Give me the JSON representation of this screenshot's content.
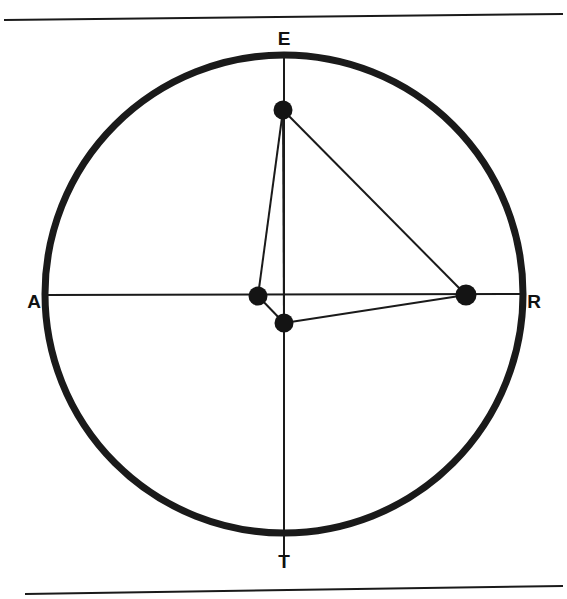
{
  "figure": {
    "background_color": "#ffffff",
    "stroke_color": "#1a1a1a",
    "node_fill_color": "#141414",
    "canvas": {
      "width": 567,
      "height": 599
    }
  },
  "rules": {
    "top": {
      "name": "top-rule",
      "x1": 4,
      "y1": 20,
      "x2": 563,
      "y2": 14,
      "stroke_width": 2
    },
    "bottom": {
      "name": "bottom-rule",
      "x1": 25,
      "y1": 594,
      "x2": 563,
      "y2": 586,
      "stroke_width": 2
    }
  },
  "circle": {
    "cx": 284,
    "cy": 294,
    "r": 239,
    "stroke_width": 7
  },
  "labels": [
    {
      "id": "E",
      "text": "E",
      "x": 284,
      "y": 45,
      "anchor": "middle"
    },
    {
      "id": "A",
      "text": "A",
      "x": 34,
      "y": 308,
      "anchor": "middle"
    },
    {
      "id": "R",
      "text": "R",
      "x": 534,
      "y": 308,
      "anchor": "middle"
    },
    {
      "id": "T",
      "text": "T",
      "x": 284,
      "y": 568,
      "anchor": "middle"
    }
  ],
  "diameters": [
    {
      "id": "AR",
      "name": "diameter-a-r",
      "x1": 45,
      "y1": 295,
      "x2": 523,
      "y2": 294,
      "stroke_width": 2
    },
    {
      "id": "ET",
      "name": "diameter-e-t",
      "x1": 284,
      "y1": 55,
      "x2": 284,
      "y2": 565,
      "stroke_width": 2
    }
  ],
  "nodes": [
    {
      "id": "P1",
      "name": "node-upper",
      "cx": 283,
      "cy": 110,
      "r": 9.5
    },
    {
      "id": "P2",
      "name": "node-center",
      "cx": 258,
      "cy": 296,
      "r": 9.5
    },
    {
      "id": "P3",
      "name": "node-lower",
      "cx": 284,
      "cy": 323,
      "r": 9.5
    },
    {
      "id": "P4",
      "name": "node-right",
      "cx": 466,
      "cy": 295,
      "r": 10.5
    }
  ],
  "chords": [
    {
      "id": "C1",
      "name": "chord-upper-to-center",
      "from": "P1",
      "to": "P2",
      "x1": 283,
      "y1": 110,
      "x2": 258,
      "y2": 296,
      "stroke_width": 2
    },
    {
      "id": "C2",
      "name": "chord-upper-to-lower",
      "from": "P1",
      "to": "P3",
      "x1": 283,
      "y1": 110,
      "x2": 284,
      "y2": 323,
      "stroke_width": 2
    },
    {
      "id": "C3",
      "name": "chord-upper-to-right",
      "from": "P1",
      "to": "P4",
      "x1": 283,
      "y1": 110,
      "x2": 466,
      "y2": 295,
      "stroke_width": 2
    },
    {
      "id": "C4",
      "name": "chord-center-to-lower",
      "from": "P2",
      "to": "P3",
      "x1": 258,
      "y1": 296,
      "x2": 284,
      "y2": 323,
      "stroke_width": 2
    },
    {
      "id": "C5",
      "name": "chord-lower-to-right",
      "from": "P3",
      "to": "P4",
      "x1": 284,
      "y1": 323,
      "x2": 466,
      "y2": 295,
      "stroke_width": 2
    }
  ]
}
